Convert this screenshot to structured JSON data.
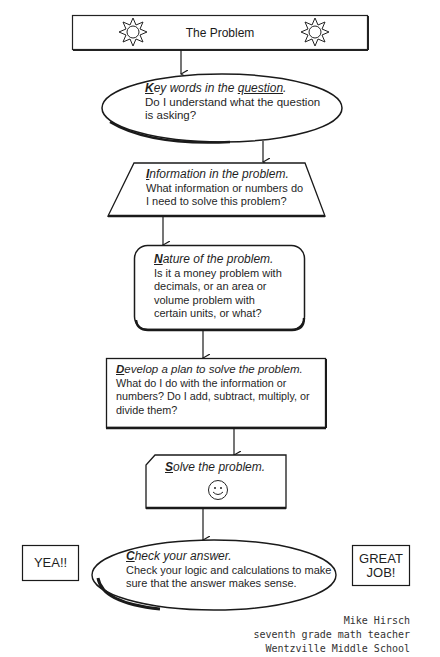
{
  "flowchart": {
    "start": {
      "label": "The Problem",
      "icons": [
        "sun-icon",
        "sun-icon"
      ]
    },
    "steps": [
      {
        "id": "key-words",
        "shape": "ellipse",
        "heading_cap": "K",
        "heading_rest_pre": "ey words in the ",
        "heading_underlined": "question",
        "heading_end": ".",
        "lines": [
          "Do I understand what the question",
          "is asking?"
        ]
      },
      {
        "id": "information",
        "shape": "trapezoid",
        "heading_cap": "I",
        "heading_rest": "nformation in the problem.",
        "lines": [
          "What information or numbers do",
          "I need to solve this problem?"
        ]
      },
      {
        "id": "nature",
        "shape": "rounded-rectangle",
        "heading_cap": "N",
        "heading_rest": "ature of the problem.",
        "lines": [
          "Is it a money problem with",
          "decimals, or an area or",
          "volume problem with",
          "certain units, or what?"
        ]
      },
      {
        "id": "develop",
        "shape": "rectangle",
        "heading_cap": "D",
        "heading_rest": "evelop a plan to solve the problem.",
        "lines": [
          "What do I do with the information or",
          "numbers? Do I add, subtract, multiply, or",
          "divide them?"
        ]
      },
      {
        "id": "solve",
        "shape": "clipped-rectangle",
        "heading_cap": "S",
        "heading_rest": "olve the problem.",
        "icon": "smiley-face-icon"
      },
      {
        "id": "check",
        "shape": "ellipse",
        "heading_cap": "C",
        "heading_rest": "heck your answer.",
        "lines": [
          "Check your logic and calculations to make",
          "sure that the answer makes sense."
        ]
      }
    ],
    "side_labels": {
      "left": "YEA!!",
      "right_line1": "GREAT",
      "right_line2": "JOB!"
    }
  },
  "credit": {
    "name": "Mike Hirsch",
    "title": "seventh grade math teacher",
    "school": "Wentzville Middle School"
  }
}
